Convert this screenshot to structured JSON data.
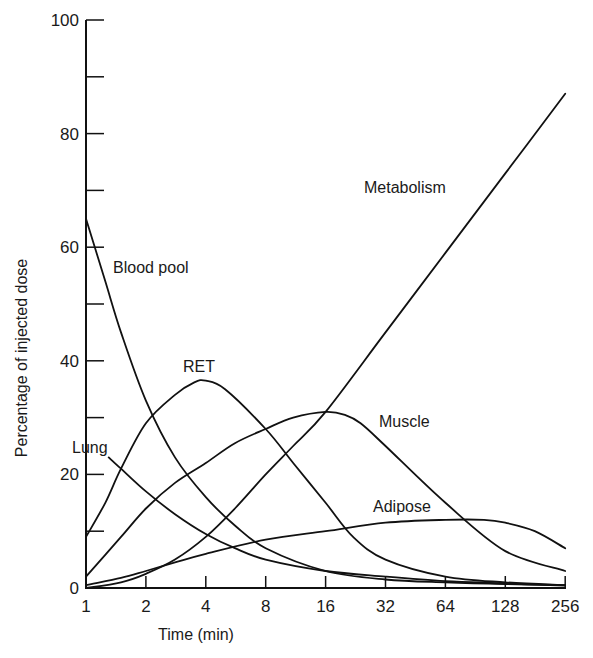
{
  "chart_data": {
    "type": "line",
    "title": "",
    "xlabel": "Time (min)",
    "ylabel": "Percentage of injected dose",
    "xscale": "log2",
    "xlim": [
      1,
      256
    ],
    "ylim": [
      0,
      100
    ],
    "x_ticks": [
      1,
      2,
      4,
      8,
      16,
      32,
      64,
      128,
      256
    ],
    "x_tick_labels": [
      "1",
      "2",
      "4",
      "8",
      "16",
      "32",
      "64",
      "128",
      "256"
    ],
    "y_ticks_major": [
      0,
      20,
      40,
      60,
      80,
      100
    ],
    "y_tick_labels": [
      "0",
      "20",
      "40",
      "60",
      "80",
      "100"
    ],
    "y_ticks_minor": [
      10,
      30,
      50,
      70,
      90
    ],
    "grid": false,
    "legend": "inline labels",
    "series": [
      {
        "name": "Blood pool",
        "x": [
          1,
          1.25,
          1.5,
          2,
          2.8,
          4,
          5.6,
          8,
          16,
          32,
          64,
          128,
          256
        ],
        "values": [
          65,
          54,
          45,
          33,
          23,
          16,
          11,
          7,
          3,
          1.5,
          1,
          0.7,
          0.5
        ]
      },
      {
        "name": "RET",
        "x": [
          1,
          1.25,
          1.5,
          2,
          2.8,
          3.5,
          4,
          5,
          8,
          11,
          16,
          22,
          32,
          64,
          128,
          256
        ],
        "values": [
          9,
          15,
          21,
          29,
          34,
          36.2,
          36.5,
          35,
          28,
          22,
          15,
          9,
          5,
          2,
          1,
          0.5
        ]
      },
      {
        "name": "Lung",
        "x": [
          1.3,
          1.5,
          2,
          2.8,
          4,
          5.6,
          8,
          16,
          32,
          64,
          128,
          256
        ],
        "values": [
          23,
          21,
          17,
          13,
          9.5,
          7,
          5,
          3,
          2,
          1.2,
          0.8,
          0.4
        ]
      },
      {
        "name": "Muscle",
        "x": [
          1,
          1.5,
          2,
          2.8,
          4,
          5.6,
          8,
          11,
          16,
          20,
          24,
          32,
          64,
          128,
          256
        ],
        "values": [
          2,
          9,
          14,
          18.5,
          22,
          25.5,
          28,
          30,
          31,
          30.5,
          29,
          25,
          15,
          6.5,
          3
        ]
      },
      {
        "name": "Metabolism",
        "x": [
          1,
          1.5,
          2,
          2.8,
          4,
          5.6,
          8,
          11,
          16,
          32,
          64,
          128,
          256
        ],
        "values": [
          0,
          1,
          2.5,
          5,
          9,
          14,
          20,
          25,
          31,
          45,
          59,
          73,
          87
        ]
      },
      {
        "name": "Adipose",
        "x": [
          1,
          1.5,
          2,
          2.8,
          4,
          8,
          16,
          32,
          64,
          100,
          128,
          180,
          256
        ],
        "values": [
          0.5,
          1.8,
          3,
          4.5,
          6,
          8.5,
          10,
          11.5,
          12,
          12,
          11.5,
          10,
          7
        ]
      }
    ],
    "annotations": [
      {
        "text": "Blood pool",
        "x_px": 113,
        "y_px": 273
      },
      {
        "text": "RET",
        "x_px": 183,
        "y_px": 372
      },
      {
        "text": "Lung",
        "x_px": 72,
        "y_px": 453
      },
      {
        "text": "Muscle",
        "x_px": 379,
        "y_px": 427
      },
      {
        "text": "Metabolism",
        "x_px": 364,
        "y_px": 193
      },
      {
        "text": "Adipose",
        "x_px": 373,
        "y_px": 512
      }
    ]
  },
  "labels": {
    "xlabel": "Time (min)",
    "ylabel": "Percentage of injected dose",
    "blood_pool": "Blood pool",
    "ret": "RET",
    "lung": "Lung",
    "muscle": "Muscle",
    "metabolism": "Metabolism",
    "adipose": "Adipose"
  }
}
